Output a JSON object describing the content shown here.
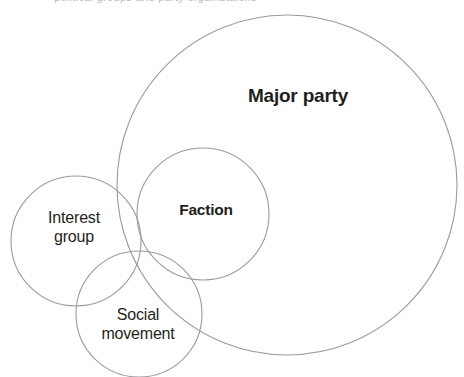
{
  "figure": {
    "background_color": "#ffffff",
    "stroke_color": "#9a9a9e",
    "label_color": "#231f20",
    "top_caption_remnant": "political groups and party organizations"
  },
  "chart_data": {
    "type": "venn",
    "title": "",
    "xlabel": "",
    "ylabel": "",
    "grid": false,
    "legend": "none",
    "canvas": {
      "width": 464,
      "height": 377
    },
    "sets": [
      {
        "name": "Major party",
        "label": "Major party",
        "label_lines": [
          "Major party"
        ],
        "label_weight": "bold",
        "cx": 287,
        "cy": 185,
        "r": 170,
        "label_x": 298,
        "label_y": 96
      },
      {
        "name": "Faction",
        "label": "Faction",
        "label_lines": [
          "Faction"
        ],
        "label_weight": "bold",
        "cx": 203,
        "cy": 214,
        "r": 66,
        "label_x": 206,
        "label_y": 210
      },
      {
        "name": "Interest group",
        "label": "Interest\ngroup",
        "label_lines": [
          "Interest",
          "group"
        ],
        "label_weight": "normal",
        "cx": 76,
        "cy": 241,
        "r": 65,
        "label_x": 74,
        "label_y": 228
      },
      {
        "name": "Social movement",
        "label": "Social\nmovement",
        "label_lines": [
          "Social",
          "movement"
        ],
        "label_weight": "normal",
        "cx": 139,
        "cy": 314,
        "r": 63,
        "label_x": 138,
        "label_y": 325
      }
    ],
    "overlaps": [
      {
        "sets": [
          "Major party",
          "Faction"
        ],
        "relation": "Faction mostly contained within Major party"
      },
      {
        "sets": [
          "Major party",
          "Interest group"
        ],
        "relation": "small overlap"
      },
      {
        "sets": [
          "Major party",
          "Social movement"
        ],
        "relation": "partial overlap"
      },
      {
        "sets": [
          "Interest group",
          "Social movement"
        ],
        "relation": "partial overlap"
      },
      {
        "sets": [
          "Faction",
          "Social movement"
        ],
        "relation": "partial overlap"
      },
      {
        "sets": [
          "Faction",
          "Interest group"
        ],
        "relation": "partial overlap"
      }
    ]
  }
}
